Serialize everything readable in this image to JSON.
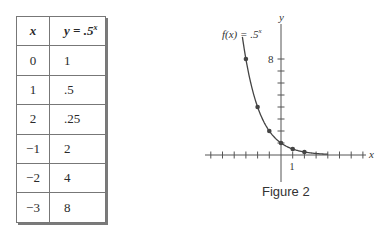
{
  "table": {
    "headers": [
      "x",
      "y = .5",
      "x"
    ],
    "header_x": "x",
    "header_y": "y = .5",
    "header_y_exp": "x",
    "rows": [
      {
        "x": "0",
        "y": "1"
      },
      {
        "x": "1",
        "y": ".5"
      },
      {
        "x": "2",
        "y": ".25"
      },
      {
        "x": "−1",
        "y": "2"
      },
      {
        "x": "−2",
        "y": "4"
      },
      {
        "x": "−3",
        "y": "8"
      }
    ]
  },
  "figure": {
    "caption": "Figure 2",
    "function_label": "f(x) = .5",
    "function_label_exp": "x",
    "x_axis_label": "x",
    "y_axis_label": "y",
    "x_tick_label": "1",
    "y_tick_label": "8"
  },
  "chart_data": {
    "type": "line",
    "title": "Figure 2",
    "function": "f(x) = .5^x",
    "xlabel": "x",
    "ylabel": "y",
    "points": [
      {
        "x": -3,
        "y": 8
      },
      {
        "x": -2,
        "y": 4
      },
      {
        "x": -1,
        "y": 2
      },
      {
        "x": 0,
        "y": 1
      },
      {
        "x": 1,
        "y": 0.5
      },
      {
        "x": 2,
        "y": 0.25
      }
    ],
    "x": [
      -3,
      -2,
      -1,
      0,
      1,
      2
    ],
    "series": [
      {
        "name": "f(x) = .5^x",
        "values": [
          8,
          4,
          2,
          1,
          0.5,
          0.25
        ]
      }
    ],
    "xlim": [
      -6,
      7
    ],
    "ylim": [
      -2,
      10
    ],
    "x_ticks": [
      -6,
      -5,
      -4,
      -3,
      -2,
      -1,
      1,
      2,
      3,
      4,
      5,
      6,
      7
    ],
    "y_ticks": [
      1,
      2,
      3,
      4,
      5,
      6,
      7,
      8
    ],
    "labeled_ticks": {
      "x": [
        1
      ],
      "y": [
        8
      ]
    },
    "grid": false,
    "legend": "none"
  }
}
